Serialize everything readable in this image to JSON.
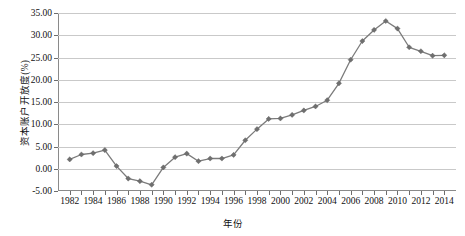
{
  "chart_data": {
    "type": "line",
    "title": "",
    "xlabel": "年份",
    "ylabel": "资本账户开放度(%)",
    "ylim": [
      -5.0,
      35.0
    ],
    "ytick_step": 5.0,
    "yticks": [
      "35.00",
      "30.00",
      "25.00",
      "20.00",
      "15.00",
      "10.00",
      "5.00",
      "0.00",
      "-5.00"
    ],
    "ytick_values": [
      35.0,
      30.0,
      25.0,
      20.0,
      15.0,
      10.0,
      5.0,
      0.0,
      -5.0
    ],
    "xlim": [
      1981,
      2015
    ],
    "xticks": [
      "1982",
      "1984",
      "1986",
      "1988",
      "1990",
      "1992",
      "1994",
      "1996",
      "1998",
      "2000",
      "2002",
      "2004",
      "2006",
      "2008",
      "2010",
      "2012",
      "2014"
    ],
    "xtick_values": [
      1982,
      1984,
      1986,
      1988,
      1990,
      1992,
      1994,
      1996,
      1998,
      2000,
      2002,
      2004,
      2006,
      2008,
      2010,
      2012,
      2014
    ],
    "grid": "horizontal",
    "legend": "none",
    "marker": "diamond",
    "series_color": "#6f6f6f",
    "line_color": "#7b7b7b",
    "grid_color": "#c9c9c9",
    "axis_color": "#8a8a8a",
    "x": [
      1982,
      1983,
      1984,
      1985,
      1986,
      1987,
      1988,
      1989,
      1990,
      1991,
      1992,
      1993,
      1994,
      1995,
      1996,
      1997,
      1998,
      1999,
      2000,
      2001,
      2002,
      2003,
      2004,
      2005,
      2006,
      2007,
      2008,
      2009,
      2010,
      2011,
      2012,
      2013,
      2014
    ],
    "values": [
      2.1,
      3.2,
      3.5,
      4.2,
      0.6,
      -2.2,
      -2.8,
      -3.6,
      0.3,
      2.6,
      3.4,
      1.7,
      2.3,
      2.3,
      3.1,
      6.4,
      8.9,
      11.2,
      11.3,
      12.1,
      13.1,
      14.0,
      15.4,
      19.2,
      24.5,
      28.7,
      31.2,
      33.2,
      31.5,
      27.3,
      26.4,
      25.4,
      25.5
    ],
    "series": [
      {
        "name": "资本账户开放度",
        "values": [
          2.1,
          3.2,
          3.5,
          4.2,
          0.6,
          -2.2,
          -2.8,
          -3.6,
          0.3,
          2.6,
          3.4,
          1.7,
          2.3,
          2.3,
          3.1,
          6.4,
          8.9,
          11.2,
          11.3,
          12.1,
          13.1,
          14.0,
          15.4,
          19.2,
          24.5,
          28.7,
          31.2,
          33.2,
          31.5,
          27.3,
          26.4,
          25.4,
          25.5
        ]
      }
    ]
  }
}
